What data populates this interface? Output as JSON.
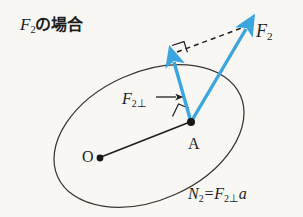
{
  "figure": {
    "title": {
      "formula": "F",
      "subscript": "2",
      "japanese_text": "の場合"
    },
    "background_color": "#f8f7f3",
    "ink_color": "#211f1e",
    "vector_color": "#3ba5e0"
  },
  "labels": {
    "force_vector": {
      "symbol": "F",
      "subscript": "2"
    },
    "perpendicular_component": {
      "symbol": "F",
      "subscript": "2",
      "perp": "⊥"
    },
    "point_a": "A",
    "point_o": "O"
  },
  "equation": {
    "lhs_symbol": "N",
    "lhs_subscript": "2",
    "equals": "=",
    "rhs_symbol": "F",
    "rhs_subscript": "2",
    "rhs_perp": "⊥",
    "rhs_radius": "a"
  },
  "geometry": {
    "ellipse": {
      "cx": 149,
      "cy": 136,
      "rx": 100,
      "ry": 64,
      "rotation_deg": -24
    },
    "point_o": {
      "x": 100,
      "y": 158
    },
    "point_a": {
      "x": 191,
      "y": 122
    },
    "arrow_f2_tip": {
      "x": 249,
      "y": 25
    },
    "arrow_f2perp_tip": {
      "x": 172,
      "y": 57
    },
    "dashed_line": {
      "x1": 177,
      "y1": 52,
      "x2": 248,
      "y2": 26
    }
  }
}
